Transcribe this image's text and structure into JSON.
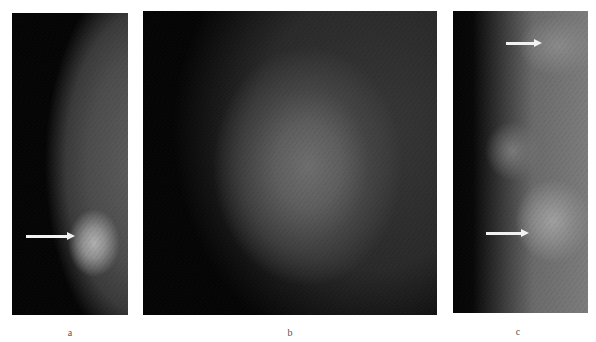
{
  "figure": {
    "panels": [
      {
        "id": "a",
        "label": "a",
        "description": "Mammogram (lateral view) with breast contour on right, bright mass in lower portion",
        "arrows": [
          {
            "direction": "right",
            "y": 236
          }
        ]
      },
      {
        "id": "b",
        "label": "b",
        "description": "Magnified view of mass, oval bright region on dark background"
      },
      {
        "id": "c",
        "label": "c",
        "description": "Mammogram with two marked lesions",
        "arrows": [
          {
            "direction": "right",
            "y": 43
          },
          {
            "direction": "right",
            "y": 233
          }
        ]
      }
    ],
    "colors": {
      "background": "#ffffff",
      "panel_dark": "#050505",
      "tissue_mid": "#5a5a5a",
      "tissue_bright": "#a8a8a8",
      "arrow": "#f2f2f2",
      "label_text": "#555555"
    }
  }
}
